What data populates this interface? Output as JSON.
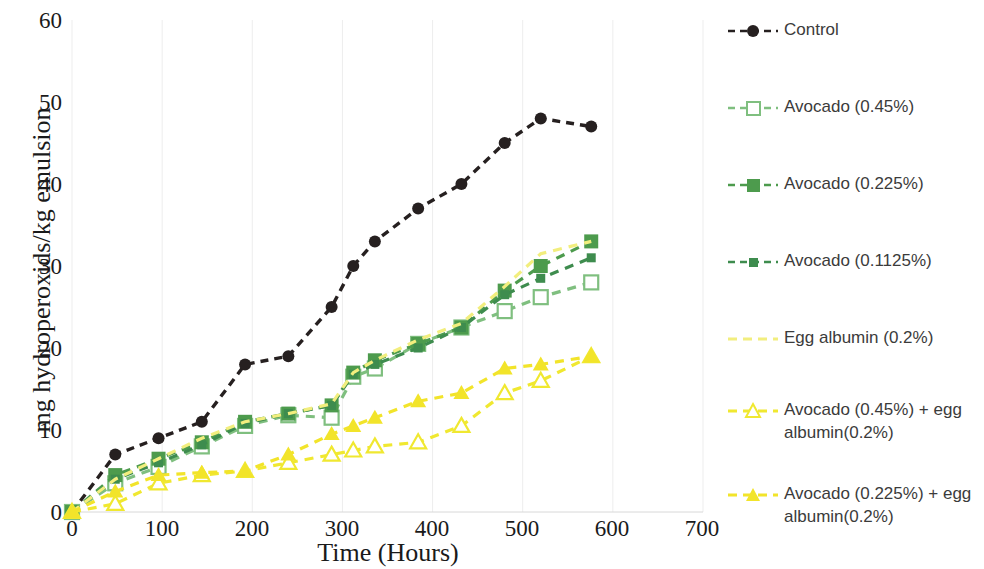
{
  "chart_data": {
    "type": "line",
    "title": "",
    "xlabel": "Time (Hours)",
    "ylabel": "mg hydroperoxids/kg emulsion",
    "xlim": [
      0,
      700
    ],
    "ylim": [
      0,
      60
    ],
    "xticks": [
      0,
      100,
      200,
      300,
      400,
      500,
      600,
      700
    ],
    "yticks": [
      0,
      10,
      20,
      30,
      40,
      50,
      60
    ],
    "grid": "vertical-only",
    "legend_position": "right",
    "series": [
      {
        "name": "Control",
        "color": "#262020",
        "marker": "circle-filled",
        "linestyle": "dashed",
        "x": [
          0,
          48,
          96,
          144,
          192,
          240,
          288,
          312,
          336,
          384,
          432,
          480,
          520,
          576
        ],
        "y": [
          0,
          7,
          9,
          11,
          18,
          19,
          25,
          30,
          33,
          37,
          40,
          45,
          48,
          47
        ]
      },
      {
        "name": "Avocado (0.45%)",
        "color": "#7FBF7F",
        "marker": "square-open",
        "linestyle": "dashed",
        "x": [
          0,
          48,
          96,
          144,
          192,
          240,
          288,
          312,
          336,
          384,
          432,
          480,
          520,
          576
        ],
        "y": [
          0,
          3.5,
          5.5,
          8,
          10.5,
          11.8,
          11.5,
          16.5,
          17.5,
          20.5,
          22.5,
          24.5,
          26.2,
          28
        ]
      },
      {
        "name": "Avocado (0.225%)",
        "color": "#4D9B4D",
        "marker": "square-filled",
        "linestyle": "dashed",
        "x": [
          0,
          48,
          96,
          144,
          192,
          240,
          288,
          312,
          336,
          384,
          432,
          480,
          520,
          576
        ],
        "y": [
          0,
          4.5,
          6.5,
          8.5,
          11,
          12,
          13,
          17,
          18.5,
          20.5,
          22.5,
          27,
          30,
          33
        ]
      },
      {
        "name": "Avocado (0.1125%)",
        "color": "#3E8C4E",
        "marker": "square-small-filled",
        "linestyle": "dashed",
        "x": [
          0,
          48,
          96,
          144,
          192,
          240,
          288,
          312,
          336,
          384,
          432,
          480,
          520,
          576
        ],
        "y": [
          0,
          4,
          6,
          8.2,
          10.8,
          12,
          13,
          16.8,
          18,
          20,
          22.5,
          26.5,
          28.5,
          31
        ]
      },
      {
        "name": "Egg albumin (0.2%)",
        "color": "#F2EE7E",
        "marker": "none",
        "linestyle": "dashed",
        "x": [
          0,
          48,
          96,
          144,
          192,
          240,
          288,
          312,
          336,
          384,
          432,
          480,
          520,
          576
        ],
        "y": [
          0,
          4,
          6.5,
          9,
          11,
          12,
          13.2,
          17,
          18.5,
          21,
          23,
          27.5,
          31.5,
          33
        ]
      },
      {
        "name": "Avocado (0.45%) + egg albumin(0.2%)",
        "color": "#F0E830",
        "marker": "triangle-open",
        "linestyle": "dashed",
        "x": [
          0,
          48,
          96,
          144,
          192,
          240,
          288,
          312,
          336,
          384,
          432,
          480,
          520,
          576
        ],
        "y": [
          0,
          1,
          3.5,
          4.5,
          5,
          6,
          7,
          7.5,
          8,
          8.5,
          10.5,
          14.5,
          16,
          19
        ]
      },
      {
        "name": "Avocado (0.225%) + egg albumin(0.2%)",
        "color": "#F2E42A",
        "marker": "triangle-filled",
        "linestyle": "dashed",
        "x": [
          0,
          48,
          96,
          144,
          192,
          240,
          288,
          312,
          336,
          384,
          432,
          480,
          520,
          576
        ],
        "y": [
          0,
          2.5,
          4.5,
          4.8,
          5,
          7,
          9.5,
          10.5,
          11.5,
          13.5,
          14.5,
          17.5,
          18,
          19
        ]
      }
    ]
  },
  "axes": {
    "ylabel": "mg hydroperoxids/kg emulsion",
    "xlabel": "Time (Hours)",
    "ytick_labels": [
      "60",
      "50",
      "40",
      "30",
      "20",
      "10",
      "0"
    ],
    "xtick_labels": [
      "0",
      "100",
      "200",
      "300",
      "400",
      "500",
      "600",
      "700"
    ]
  },
  "legend": {
    "items": [
      {
        "label": "Control"
      },
      {
        "label": "Avocado (0.45%)"
      },
      {
        "label": "Avocado (0.225%)"
      },
      {
        "label": "Avocado (0.1125%)"
      },
      {
        "label": "Egg albumin (0.2%)"
      },
      {
        "label": "Avocado (0.45%) + egg\nalbumin(0.2%)"
      },
      {
        "label": "Avocado (0.225%) + egg\nalbumin(0.2%)"
      }
    ]
  }
}
